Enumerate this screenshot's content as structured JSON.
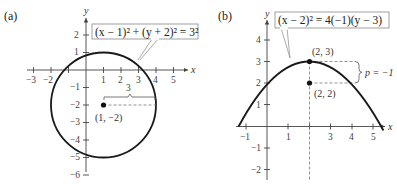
{
  "panel_a": {
    "label": "(a)",
    "axis_x_label": "x",
    "axis_y_label": "y",
    "x_ticks": [
      "−3",
      "−2",
      "1",
      "2",
      "3",
      "4",
      "5"
    ],
    "y_ticks": [
      "2",
      "1",
      "−1",
      "−2",
      "−3",
      "−4",
      "−5",
      "−6"
    ],
    "equation": "(x − 1)² + (y + 2)² = 3²",
    "center_label": "(1, −2)",
    "radius_label": "3",
    "shape": "circle",
    "center": [
      1,
      -2
    ],
    "radius": 3
  },
  "panel_b": {
    "label": "(b)",
    "axis_x_label": "x",
    "axis_y_label": "y",
    "x_ticks": [
      "−1",
      "1",
      "3",
      "4",
      "5"
    ],
    "y_ticks": [
      "4",
      "3",
      "2",
      "1",
      "−1",
      "−2"
    ],
    "equation": "(x − 2)² = 4(−1)(y − 3)",
    "vertex_label": "(2, 3)",
    "focus_label": "(2, 2)",
    "p_label": "p = −1",
    "shape": "parabola",
    "vertex": [
      2,
      3
    ],
    "focus": [
      2,
      2
    ],
    "p": -1
  },
  "colors": {
    "curve": "#1a1a1a",
    "axis": "#444444",
    "dashed": "#777777",
    "box_border": "#888888"
  }
}
